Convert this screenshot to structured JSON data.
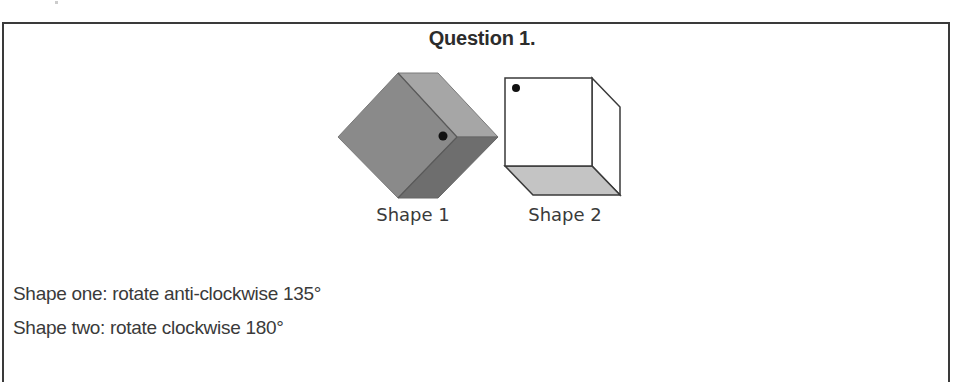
{
  "question": {
    "title": "Question 1."
  },
  "figure": {
    "shapes": [
      {
        "label": "Shape 1",
        "description": "grey cube viewed corner-on (diamond orientation) with black dot near inner vertex"
      },
      {
        "label": "Shape 2",
        "description": "white cube front face with black dot at top-left corner, shaded grey bottom face"
      }
    ],
    "colors": {
      "shape1_left_face": "#8a8a8a",
      "shape1_top_right_face": "#a6a6a6",
      "shape1_bottom_right_face": "#6e6e6e",
      "shape2_front_face": "#ffffff",
      "shape2_bottom_face": "#c4c4c4",
      "dot": "#111111",
      "outline": "#3a3a3a"
    }
  },
  "instructions": [
    "Shape one: rotate anti-clockwise 135°",
    "Shape two: rotate clockwise 180°"
  ]
}
